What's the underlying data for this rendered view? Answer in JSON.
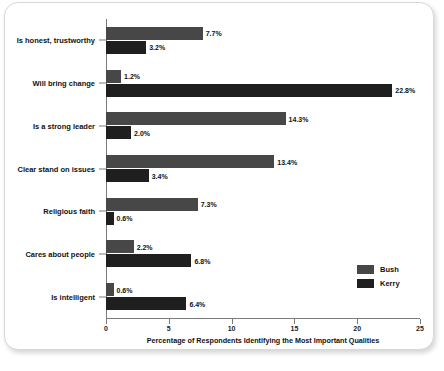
{
  "chart_data": {
    "type": "bar",
    "orientation": "horizontal",
    "title": "",
    "xlabel": "Percentage of Respondents Identifying the Most Important Qualities",
    "ylabel": "",
    "xlim": [
      0,
      25
    ],
    "xticks": [
      "0",
      "5",
      "10",
      "15",
      "20",
      "25"
    ],
    "grid": false,
    "legend_position": "lower-right",
    "categories": [
      "Is honest, trustworthy",
      "Will bring change",
      "Is a strong leader",
      "Clear stand on issues",
      "Religious faith",
      "Cares about people",
      "Is intelligent"
    ],
    "series": [
      {
        "name": "Bush",
        "color": "#474747",
        "values": [
          7.7,
          1.2,
          14.3,
          13.4,
          7.3,
          2.2,
          0.6
        ],
        "labels": [
          "7.7%",
          "1.2%",
          "14.3%",
          "13.4%",
          "7.3%",
          "2.2%",
          "0.6%"
        ]
      },
      {
        "name": "Kerry",
        "color": "#1f1f1f",
        "values": [
          3.2,
          22.8,
          2.0,
          3.4,
          0.6,
          6.8,
          6.4
        ],
        "labels": [
          "3.2%",
          "22.8%",
          "2.0%",
          "3.4%",
          "0.6%",
          "6.8%",
          "6.4%"
        ]
      }
    ]
  },
  "legend": {
    "entries": [
      {
        "label": "Bush",
        "color": "#474747"
      },
      {
        "label": "Kerry",
        "color": "#1f1f1f"
      }
    ]
  }
}
